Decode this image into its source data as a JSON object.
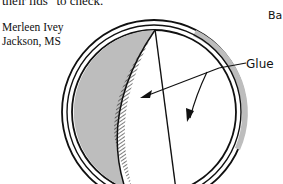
{
  "document": {
    "top_text": "their lids\" to check.",
    "byline": {
      "name": "Merleen Ivey",
      "location": "Jackson, MS"
    }
  },
  "figure": {
    "corner_label": "Ba",
    "callout_label": "Glue",
    "colors": {
      "line": "#111111",
      "shading": "#bdbdbd",
      "background": "#ffffff"
    }
  }
}
